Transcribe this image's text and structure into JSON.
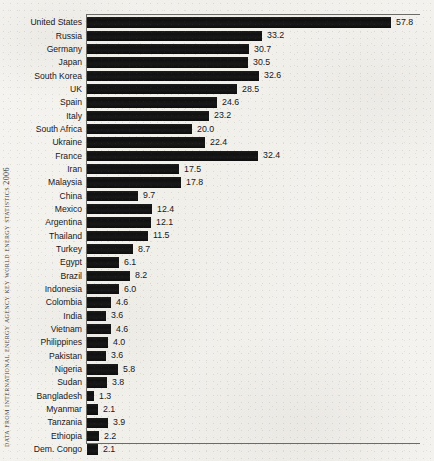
{
  "source_caption": "Data from International Energy Agency Key World Energy Statistics 2006",
  "colors": {
    "bar": "#141414",
    "axis": "#6d6b66",
    "text": "#17171a",
    "paper": "#f4f2ee"
  },
  "chart_data": {
    "type": "bar",
    "orientation": "horizontal",
    "title": "",
    "subtitle": "",
    "xlabel": "",
    "ylabel": "",
    "xlim": [
      0,
      63.3
    ],
    "grid": false,
    "legend": null,
    "value_labels_shown": true,
    "categories": [
      "United States",
      "Russia",
      "Germany",
      "Japan",
      "South Korea",
      "UK",
      "Spain",
      "Italy",
      "South Africa",
      "Ukraine",
      "France",
      "Iran",
      "Malaysia",
      "China",
      "Mexico",
      "Argentina",
      "Thailand",
      "Turkey",
      "Egypt",
      "Brazil",
      "Indonesia",
      "Colombia",
      "India",
      "Vietnam",
      "Philippines",
      "Pakistan",
      "Nigeria",
      "Sudan",
      "Bangladesh",
      "Myanmar",
      "Tanzania",
      "Ethiopia",
      "Dem. Congo"
    ],
    "values": [
      57.8,
      33.2,
      30.7,
      30.5,
      32.6,
      28.5,
      24.6,
      23.2,
      20.0,
      22.4,
      32.4,
      17.5,
      17.8,
      9.7,
      12.4,
      12.1,
      11.5,
      8.7,
      6.1,
      8.2,
      6.0,
      4.6,
      3.6,
      4.6,
      4.0,
      3.6,
      5.8,
      3.8,
      1.3,
      2.1,
      3.9,
      2.2,
      2.1
    ],
    "value_label_strings": [
      "57.8",
      "33.2",
      "30.7",
      "30.5",
      "32.6",
      "28.5",
      "24.6",
      "23.2",
      "20.0",
      "22.4",
      "32.4",
      "17.5",
      "17.8",
      "9.7",
      "12.4",
      "12.1",
      "11.5",
      "8.7",
      "6.1",
      "8.2",
      "6.0",
      "4.6",
      "3.6",
      "4.6",
      "4.0",
      "3.6",
      "5.8",
      "3.8",
      "1.3",
      "2.1",
      "3.9",
      "2.2",
      "2.1"
    ],
    "bar_pixel_lengths": [
      304,
      175,
      162,
      161,
      172,
      150,
      130,
      122,
      105,
      118,
      171,
      92,
      94,
      51,
      65,
      64,
      61,
      46,
      32,
      43,
      32,
      24,
      19,
      24,
      21,
      19,
      31,
      20,
      7,
      11,
      21,
      12,
      11
    ]
  }
}
